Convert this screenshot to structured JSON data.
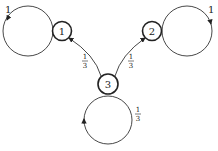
{
  "diagram": {
    "type": "markov-chain",
    "nodes": [
      {
        "id": "1",
        "label": "1",
        "cx": 62,
        "cy": 31
      },
      {
        "id": "2",
        "label": "2",
        "cx": 152,
        "cy": 31
      },
      {
        "id": "3",
        "label": "3",
        "cx": 108,
        "cy": 84
      }
    ],
    "self_loops": [
      {
        "node": "1",
        "label": "1"
      },
      {
        "node": "2",
        "label": "1"
      },
      {
        "node": "3",
        "label_num": "1",
        "label_den": "3"
      }
    ],
    "edges": [
      {
        "from": "3",
        "to": "1",
        "label_num": "1",
        "label_den": "3"
      },
      {
        "from": "3",
        "to": "2",
        "label_num": "1",
        "label_den": "3"
      }
    ]
  }
}
